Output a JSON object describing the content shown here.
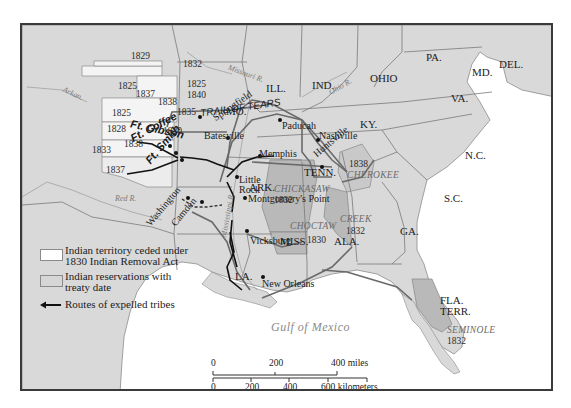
{
  "map": {
    "title": "Indian Removal Routes",
    "colors": {
      "land": "#d9d9d9",
      "ceded_territory": "#f4f4f4",
      "reservation": "#b9b9b9",
      "water": "#ffffff",
      "route_expelled": "#111111",
      "trail_of_tears": "#6a6a6a",
      "border": "#7a7a7a"
    },
    "states": [
      {
        "label": "ILL."
      },
      {
        "label": "IND."
      },
      {
        "label": "OHIO"
      },
      {
        "label": "PA."
      },
      {
        "label": "MD."
      },
      {
        "label": "DEL."
      },
      {
        "label": "VA."
      },
      {
        "label": "KY."
      },
      {
        "label": "N.C."
      },
      {
        "label": "TENN."
      },
      {
        "label": "S.C."
      },
      {
        "label": "GA."
      },
      {
        "label": "ALA."
      },
      {
        "label": "MISS."
      },
      {
        "label": "LA."
      },
      {
        "label": "ARK."
      },
      {
        "label": "MO."
      },
      {
        "label": "FLA."
      },
      {
        "label": "TERR."
      }
    ],
    "cities": [
      {
        "label": "Springfield"
      },
      {
        "label": "Batesville"
      },
      {
        "label": "Paducah"
      },
      {
        "label": "Nashville"
      },
      {
        "label": "Huntsville"
      },
      {
        "label": "Memphis"
      },
      {
        "label": "Little"
      },
      {
        "label": "Rock"
      },
      {
        "label": "Montgomery's Point"
      },
      {
        "label": "Vicksburg"
      },
      {
        "label": "New Orleans"
      },
      {
        "label": "Washington"
      },
      {
        "label": "Camden"
      }
    ],
    "forts": [
      {
        "label": "Ft. Gibson"
      },
      {
        "label": "Ft. Coffee"
      },
      {
        "label": "Ft. Smith"
      }
    ],
    "rivers": [
      {
        "label": "Missouri R."
      },
      {
        "label": "Ohio R."
      },
      {
        "label": "Arkan."
      },
      {
        "label": "Red R."
      },
      {
        "label": "Mississippi R."
      }
    ],
    "routes": [
      {
        "label": "TRAIL OF TEARS"
      }
    ],
    "reservations": [
      {
        "tribe": "CHICKASAW",
        "year": "1832"
      },
      {
        "tribe": "CHOCTAW",
        "year": "1830"
      },
      {
        "tribe": "CREEK",
        "year": "1832"
      },
      {
        "tribe": "CHEROKEE",
        "year": "1838"
      },
      {
        "tribe": "SEMINOLE",
        "year": "1832"
      }
    ],
    "ceded_years": [
      "1829",
      "1832",
      "1825",
      "1837",
      "1825",
      "1840",
      "1838",
      "1825",
      "1835",
      "1828",
      "1820",
      "1833",
      "1838",
      "1837"
    ],
    "water_body": "Gulf of Mexico"
  },
  "legend": {
    "items": [
      {
        "label": "Indian territory ceded under",
        "label2": "1830 Indian Removal Act",
        "swatch": "#ffffff"
      },
      {
        "label": "Indian reservations with",
        "label2": "treaty date",
        "swatch": "#d6d6d6"
      },
      {
        "label": "Routes of expelled tribes",
        "swatch": "arrow-left"
      }
    ]
  },
  "scale": {
    "miles": {
      "ticks": [
        "0",
        "200",
        "400 miles"
      ]
    },
    "kilometers": {
      "ticks": [
        "0",
        "200",
        "400",
        "600 kilometers"
      ]
    }
  }
}
